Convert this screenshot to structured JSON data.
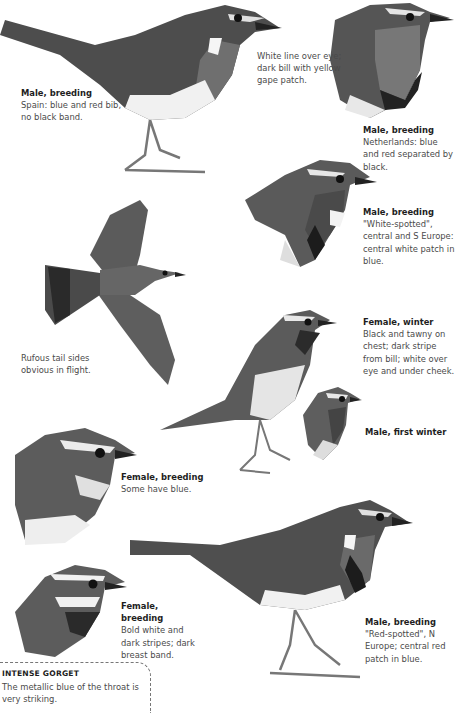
{
  "figures": [
    {
      "id": "male-spain",
      "title": "Male, breeding",
      "desc": "Spain: blue and red bib, no black band."
    },
    {
      "id": "note-eye",
      "title": "",
      "desc": "White line over eye; dark bill with yellow gape patch."
    },
    {
      "id": "male-netherlands",
      "title": "Male, breeding",
      "desc": "Netherlands: blue and red separated by black."
    },
    {
      "id": "male-white-spotted",
      "title": "Male, breeding",
      "desc": "\"White-spotted\", central and S Europe: central white patch in blue."
    },
    {
      "id": "note-flight",
      "title": "",
      "desc": "Rufous tail sides obvious in flight."
    },
    {
      "id": "female-winter",
      "title": "Female, winter",
      "desc": "Black and tawny on chest; dark stripe from bill; white over eye and under cheek."
    },
    {
      "id": "male-first-winter",
      "title": "Male, first winter",
      "desc": ""
    },
    {
      "id": "female-breeding-blue",
      "title": "Female, breeding",
      "desc": "Some have blue."
    },
    {
      "id": "female-breeding-bold",
      "title": "Female, breeding",
      "desc": "Bold white and dark stripes; dark breast band."
    },
    {
      "id": "male-red-spotted",
      "title": "Male, breeding",
      "desc": "\"Red-spotted\", N Europe; central red patch in blue."
    }
  ],
  "gorget": {
    "title": "INTENSE GORGET",
    "desc": "The metallic blue of the throat is very striking."
  },
  "colors": {
    "ink": "#1e1e1e",
    "text": "#4a4a4a",
    "bird_dark": "#3c3c3c",
    "bird_mid": "#6e6e6e",
    "bird_light": "#bdbdbd",
    "breast": "#e8e8e8"
  }
}
